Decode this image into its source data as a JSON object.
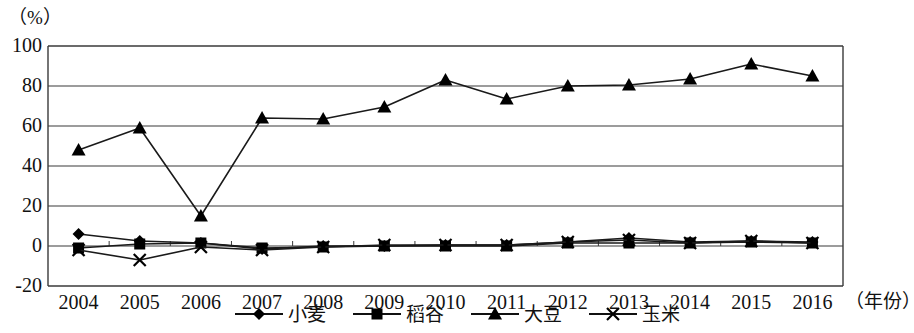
{
  "chart_data": {
    "type": "line",
    "title": "",
    "subtitle": "",
    "ylabel": "（%）",
    "xlabel": "（年份）",
    "grid": true,
    "legend_position": "bottom",
    "ylim": [
      -20,
      100
    ],
    "yticks": [
      "100",
      "80",
      "60",
      "40",
      "20",
      "0",
      "-20"
    ],
    "ytick_values": [
      100,
      80,
      60,
      40,
      20,
      0,
      -20
    ],
    "categories": [
      "2004",
      "2005",
      "2006",
      "2007",
      "2008",
      "2009",
      "2010",
      "2011",
      "2012",
      "2013",
      "2014",
      "2015",
      "2016"
    ],
    "series": [
      {
        "name": "小麦",
        "marker": "diamond",
        "values": [
          6,
          2.5,
          1.5,
          -1.5,
          0,
          0,
          0.5,
          0.5,
          2,
          4,
          2,
          2.5,
          2
        ]
      },
      {
        "name": "稻谷",
        "marker": "square",
        "values": [
          -1,
          1,
          1.5,
          -1,
          -0.5,
          0,
          0,
          0,
          1.5,
          1.5,
          1.5,
          2,
          1.5
        ]
      },
      {
        "name": "大豆",
        "marker": "triangle",
        "values": [
          48,
          59,
          15,
          64,
          63.5,
          69.5,
          83,
          73.5,
          80,
          80.5,
          83.5,
          91,
          85
        ]
      },
      {
        "name": "玉米",
        "marker": "cross",
        "values": [
          -2,
          -7,
          -0.5,
          -2,
          -0.5,
          0.5,
          0.5,
          0.5,
          2,
          3,
          1.5,
          2.5,
          1.5
        ]
      }
    ]
  },
  "axes": {
    "unit_label": "（%）",
    "x_unit_label": "（年份）"
  }
}
